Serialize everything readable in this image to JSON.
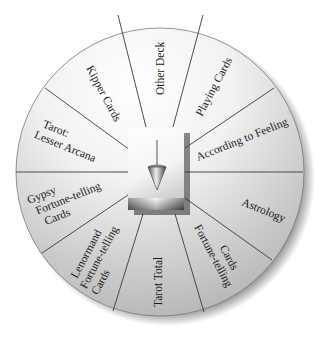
{
  "diagram": {
    "type": "pendulum-chart",
    "title": "",
    "center_icon": "pendulum-icon",
    "segments": [
      {
        "id": "other-deck",
        "lines": [
          "Other Deck"
        ]
      },
      {
        "id": "playing-cards",
        "lines": [
          "Playing Cards"
        ]
      },
      {
        "id": "according-to-feeling",
        "lines": [
          "According to Feeling"
        ]
      },
      {
        "id": "astrology",
        "lines": [
          "Astrology"
        ]
      },
      {
        "id": "fortune-telling-cards",
        "lines": [
          "Fortune-telling",
          "Cards"
        ]
      },
      {
        "id": "tarot-total",
        "lines": [
          "Tarot Total"
        ]
      },
      {
        "id": "lenormand",
        "lines": [
          "Lenormand",
          "Fortune-telling",
          "Cards"
        ]
      },
      {
        "id": "gypsy",
        "lines": [
          "Gypsy",
          "Fortune-telling",
          "Cards"
        ]
      },
      {
        "id": "tarot-lesser-arcana",
        "lines": [
          "Tarot:",
          "Lesser Arcana"
        ]
      },
      {
        "id": "kipper-cards",
        "lines": [
          "Kipper Cards"
        ]
      }
    ],
    "colors": {
      "light": "#ffffff",
      "mid": "#d4d4d4",
      "dark": "#9a9a9a",
      "divider": "#3a3a3a",
      "text": "#1a1a1a"
    }
  }
}
